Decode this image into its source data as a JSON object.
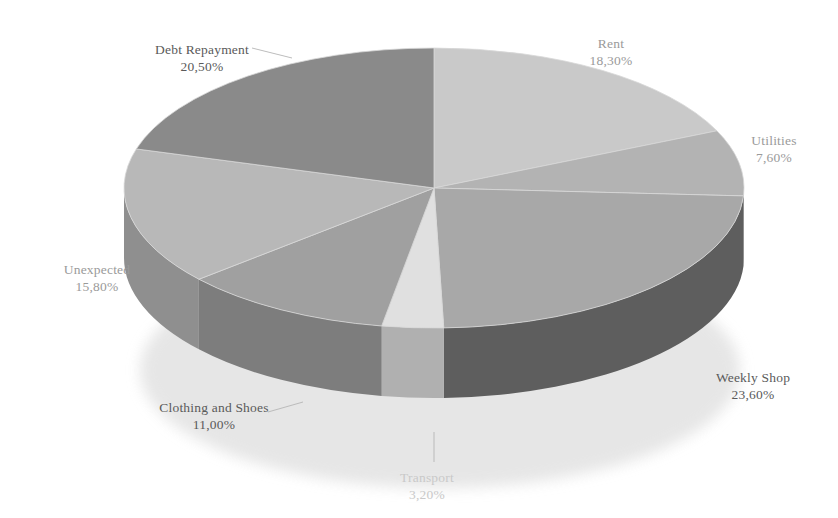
{
  "chart_data": {
    "type": "pie",
    "title": "",
    "subtitle": "",
    "xlabel": "",
    "ylabel": "",
    "legend_position": "none",
    "grid": false,
    "style": "3d-exploded-disc",
    "value_unit": "percent",
    "value_format": "comma-decimal",
    "start_angle_deg": 0,
    "direction": "clockwise",
    "total": 100.0,
    "categories": [
      "Rent",
      "Utilities",
      "Weekly Shop",
      "Transport",
      "Clothing and Shoes",
      "Unexpected",
      "Debt Repayment"
    ],
    "values": [
      18.3,
      7.6,
      23.6,
      3.2,
      11.0,
      15.8,
      20.5
    ],
    "labels": [
      "18,30%",
      "7,60%",
      "23,60%",
      "3,20%",
      "11,00%",
      "15,80%",
      "20,50%"
    ],
    "colors": [
      "#c9c9c9",
      "#b3b3b3",
      "#a8a8a8",
      "#e0e0e0",
      "#a0a0a0",
      "#b8b8b8",
      "#8a8a8a"
    ],
    "side_colors": [
      "#9a9a9a",
      "#8c8c8c",
      "#5e5e5e",
      "#b0b0b0",
      "#7d7d7d",
      "#8f8f8f",
      "#6e6e6e"
    ]
  },
  "slices": [
    {
      "name": "Rent",
      "percent_label": "18,30%"
    },
    {
      "name": "Utilities",
      "percent_label": "7,60%"
    },
    {
      "name": "Weekly Shop",
      "percent_label": "23,60%"
    },
    {
      "name": "Transport",
      "percent_label": "3,20%"
    },
    {
      "name": "Clothing and Shoes",
      "percent_label": "11,00%"
    },
    {
      "name": "Unexpected",
      "percent_label": "15,80%"
    },
    {
      "name": "Debt Repayment",
      "percent_label": "20,50%"
    }
  ]
}
